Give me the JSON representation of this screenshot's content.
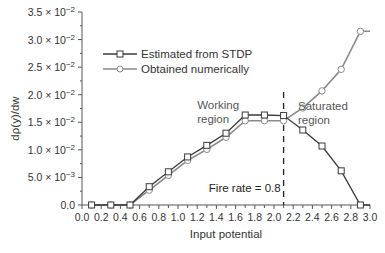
{
  "chart_data": {
    "type": "line",
    "title": "",
    "xlabel": "Input potential",
    "ylabel": "dρ(y)/dw",
    "xlim": [
      0.0,
      3.0
    ],
    "ylim": [
      0.0,
      0.035
    ],
    "grid": false,
    "x_ticks": [
      "0.0",
      "0.2",
      "0.4",
      "0.6",
      "0.8",
      "1.0",
      "1.2",
      "1.4",
      "1.6",
      "1.8",
      "2.0",
      "2.2",
      "2.4",
      "2.6",
      "2.8",
      "3.0"
    ],
    "x_tick_values": [
      0.0,
      0.2,
      0.4,
      0.6,
      0.8,
      1.0,
      1.2,
      1.4,
      1.6,
      1.8,
      2.0,
      2.2,
      2.4,
      2.6,
      2.8,
      3.0
    ],
    "y_ticks": [
      {
        "value": 0.0,
        "label": "0.0",
        "mant": "",
        "exp": ""
      },
      {
        "value": 0.005,
        "label": "5.0 × 10⁻³",
        "mant": "5.0 × 10",
        "exp": "−3"
      },
      {
        "value": 0.01,
        "label": "1.0 × 10⁻²",
        "mant": "1.0 × 10",
        "exp": "−2"
      },
      {
        "value": 0.015,
        "label": "1.5 × 10⁻²",
        "mant": "1.5 × 10",
        "exp": "−2"
      },
      {
        "value": 0.02,
        "label": "2.0 × 10⁻²",
        "mant": "2.0 × 10",
        "exp": "−2"
      },
      {
        "value": 0.025,
        "label": "2.5 × 10⁻²",
        "mant": "2.5 × 10",
        "exp": "−2"
      },
      {
        "value": 0.03,
        "label": "3.0 × 10⁻²",
        "mant": "3.0 × 10",
        "exp": "−2"
      },
      {
        "value": 0.035,
        "label": "3.5 × 10⁻²",
        "mant": "3.5 × 10",
        "exp": "−2"
      }
    ],
    "legend_position": "upper-left",
    "series": [
      {
        "name": "Estimated from STDP",
        "marker": "square",
        "color": "#3a3a3a",
        "x": [
          0.1,
          0.3,
          0.5,
          0.7,
          0.9,
          1.1,
          1.3,
          1.5,
          1.7,
          1.9,
          2.1,
          2.3,
          2.5,
          2.7,
          2.9,
          3.0
        ],
        "y": [
          0.0,
          0.0,
          0.0,
          0.0031,
          0.0058,
          0.0085,
          0.0106,
          0.0128,
          0.0161,
          0.0161,
          0.016,
          0.0136,
          0.0107,
          0.0062,
          0.0,
          0.0
        ],
        "marker_mask": [
          1,
          1,
          1,
          1,
          1,
          1,
          1,
          1,
          1,
          1,
          1,
          1,
          1,
          1,
          1,
          0
        ]
      },
      {
        "name": "Obtained numerically",
        "marker": "circle",
        "color": "#8a8a8a",
        "x": [
          0.1,
          0.3,
          0.5,
          0.7,
          0.9,
          1.1,
          1.3,
          1.5,
          1.7,
          1.9,
          2.1,
          2.3,
          2.5,
          2.7,
          2.9,
          3.0
        ],
        "y": [
          0.0,
          0.0,
          0.0,
          0.0029,
          0.0056,
          0.0083,
          0.0103,
          0.0125,
          0.0155,
          0.0155,
          0.0155,
          0.0176,
          0.0207,
          0.0246,
          0.0315,
          0.0315
        ],
        "marker_mask": [
          1,
          1,
          1,
          1,
          1,
          1,
          1,
          1,
          1,
          1,
          1,
          1,
          1,
          1,
          1,
          0
        ]
      }
    ],
    "vline": {
      "x": 2.1,
      "style": "dashed"
    },
    "annotations": [
      {
        "id": "working",
        "lines": [
          "Working",
          "region"
        ],
        "x": 1.2,
        "y": 0.0175
      },
      {
        "id": "saturated",
        "lines": [
          "Saturated",
          "region"
        ],
        "x": 2.25,
        "y": 0.0172
      },
      {
        "id": "fire",
        "lines": [
          "Fire rate = 0.8"
        ],
        "x": 2.07,
        "y": 0.0023
      }
    ]
  }
}
